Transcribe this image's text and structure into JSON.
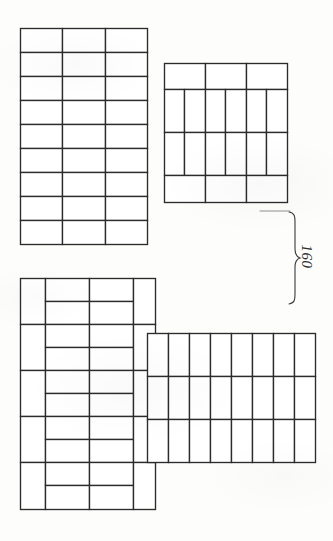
{
  "document": {
    "kind": "scanned-technical-drawing",
    "subject": "masonry bond pattern layouts",
    "background_color": "#fdfdfc",
    "ink_color": "#2b2b2b"
  },
  "annotations": {
    "dimension": {
      "label": "160",
      "rotation_degrees": 90,
      "bracket": "curly-brace",
      "bracket_side": "right"
    }
  },
  "figures": [
    {
      "id": "upper-assembly",
      "name": "upper-pattern-assembly",
      "panels": [
        {
          "id": "upper-left-panel",
          "name": "stretcher-stack-panel",
          "x": 20,
          "y": 28,
          "width": 128,
          "height": 217,
          "orientation": "horizontal",
          "columns": 3,
          "rows": 9,
          "brick_count": 27
        },
        {
          "id": "upper-right-panel",
          "name": "soldier-course-panel",
          "x": 164,
          "y": 63,
          "width": 124,
          "height": 140,
          "bands": [
            {
              "type": "header-row",
              "orientation": "horizontal",
              "count": 3,
              "height": 28
            },
            {
              "type": "soldier-row",
              "orientation": "vertical",
              "count": 6,
              "height": 42
            },
            {
              "type": "soldier-row",
              "orientation": "vertical",
              "count": 6,
              "height": 42
            },
            {
              "type": "header-row",
              "orientation": "horizontal",
              "count": 3,
              "height": 28
            }
          ],
          "brick_count": 18
        }
      ]
    },
    {
      "id": "lower-assembly",
      "name": "lower-pattern-assembly",
      "panels": [
        {
          "id": "lower-left-panel",
          "name": "basketweave-border-panel",
          "x": 20,
          "y": 278,
          "width": 135,
          "height": 232,
          "rows": 5,
          "row_height": 46,
          "edge_course": "vertical-soldier",
          "infill": "paired-stretchers",
          "infill_columns": 2,
          "infill_rows_per_cell": 2,
          "brick_count": 30
        },
        {
          "id": "lower-right-panel",
          "name": "soldier-field-panel",
          "x": 147,
          "y": 333,
          "width": 168,
          "height": 130,
          "orientation": "vertical",
          "columns": 8,
          "rows": 3,
          "brick_count": 24
        }
      ]
    }
  ]
}
